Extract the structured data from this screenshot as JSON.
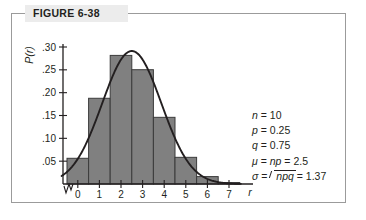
{
  "figure": {
    "caption": "FIGURE 6-38",
    "frame_color": "#9b9b9b",
    "caption_bg": "#ececec"
  },
  "params": {
    "n": {
      "symbol": "n",
      "eq": "=",
      "value": "10"
    },
    "p": {
      "symbol": "p",
      "eq": "=",
      "value": "0.25"
    },
    "q": {
      "symbol": "q",
      "eq": "=",
      "value": "0.75"
    },
    "mu": {
      "symbol": "μ",
      "eq1": "=",
      "expr": "np",
      "eq2": "=",
      "value": "2.5"
    },
    "sigma": {
      "symbol": "σ",
      "eq1": "=",
      "radicand": "npq",
      "eq2": "=",
      "value": "1.37"
    }
  },
  "chart_data": {
    "type": "bar",
    "title": "FIGURE 6-38",
    "xlabel": "r",
    "ylabel": "P(r)",
    "categories": [
      "0",
      "1",
      "2",
      "3",
      "4",
      "5",
      "6",
      "7"
    ],
    "values": [
      0.0563,
      0.1877,
      0.2816,
      0.2503,
      0.146,
      0.0584,
      0.0162,
      0.0031
    ],
    "xtick_labels": [
      "0",
      "1",
      "2",
      "3",
      "4",
      "5",
      "6",
      "7"
    ],
    "ytick_labels": [
      ".05",
      ".10",
      ".15",
      ".20",
      ".25",
      ".30"
    ],
    "ytick_values": [
      0.05,
      0.1,
      0.15,
      0.2,
      0.25,
      0.3
    ],
    "ylim": [
      0,
      0.305
    ],
    "xlim": [
      -0.5,
      7.5
    ],
    "grid": false,
    "legend": null,
    "bar_fill": "#808080",
    "bar_stroke": "#3b3b3b",
    "curve_color": "#231f20",
    "curve_label": "normal approximation curve",
    "axis_break": true,
    "annotations": [
      "n = 10",
      "p = 0.25",
      "q = 0.75",
      "μ = np = 2.5",
      "σ = √npq = 1.37"
    ]
  }
}
